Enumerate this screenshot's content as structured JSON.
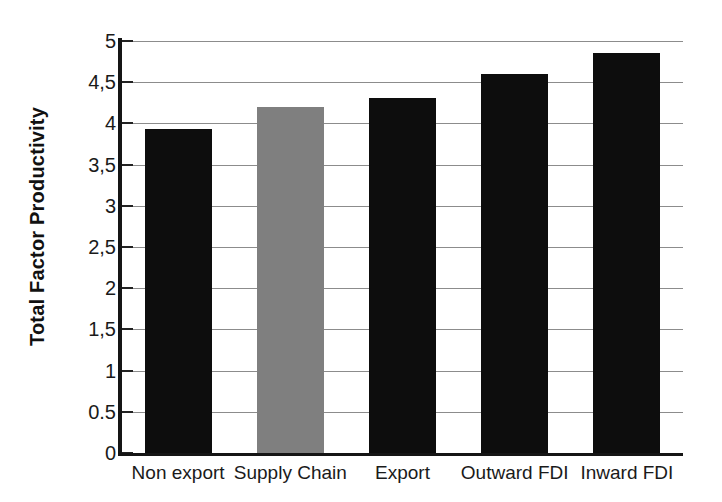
{
  "chart_data": {
    "type": "bar",
    "title": "",
    "subtitle": "",
    "xlabel": "",
    "ylabel": "Total Factor Productivity",
    "categories": [
      "Non export",
      "Supply Chain",
      "Export",
      "Outward FDI",
      "Inward FDI"
    ],
    "values": [
      3.93,
      4.2,
      4.31,
      4.6,
      4.86
    ],
    "bar_colors": [
      "#0d0d0d",
      "#7f7f7f",
      "#0d0d0d",
      "#0d0d0d",
      "#0d0d0d"
    ],
    "ylim": [
      0,
      5
    ],
    "ytick_values": [
      0,
      0.5,
      1,
      1.5,
      2,
      2.5,
      3,
      3.5,
      4,
      4.5,
      5
    ],
    "ytick_labels": [
      "0",
      "0.5",
      "1",
      "1,5",
      "2",
      "2,5",
      "3",
      "3,5",
      "4",
      "4,5",
      "5"
    ],
    "grid": true,
    "grid_axis": "y",
    "legend": false,
    "legend_position": "none",
    "series": [
      {
        "name": "Total Factor Productivity",
        "values": [
          3.93,
          4.2,
          4.31,
          4.6,
          4.86
        ]
      }
    ],
    "annotations": [],
    "colors": {
      "default_bar": "#0d0d0d",
      "highlight_bar": "#7f7f7f",
      "gridline": "#8c8c8c",
      "axis": "#151515",
      "text": "#1a1a1a",
      "background": "#ffffff"
    }
  }
}
